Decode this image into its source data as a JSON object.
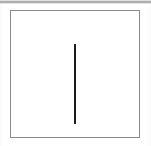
{
  "figure": {
    "kind": "line-figure-panel",
    "caption": "",
    "background_color": "#ffffff",
    "frame": {
      "border_color": "#8a8a8a",
      "border_width_px": 1,
      "fill_color": "#ffffff",
      "left_px": 10,
      "top_px": 10,
      "width_px": 130,
      "height_px": 128
    },
    "artifacts": {
      "top_band_color": "#9c9c9c",
      "margin_shade_color": "#fbfbfb"
    }
  },
  "chart_data": {
    "type": "line",
    "title": "",
    "subtitle": "",
    "xlabel": "",
    "ylabel": "",
    "grid": false,
    "legend": null,
    "axis_ticks_x": [],
    "axis_ticks_y": [],
    "tick_labels_x": [],
    "tick_labels_y": [],
    "annotations": [],
    "xlim": [
      0,
      130
    ],
    "ylim": [
      0,
      128
    ],
    "series": [
      {
        "name": "vertical-segment",
        "color": "#1c1c1c",
        "line_width_px": 2,
        "x": [
          64,
          64
        ],
        "y": [
          33,
          113
        ],
        "orientation": "vertical",
        "length_px": 80
      }
    ]
  }
}
